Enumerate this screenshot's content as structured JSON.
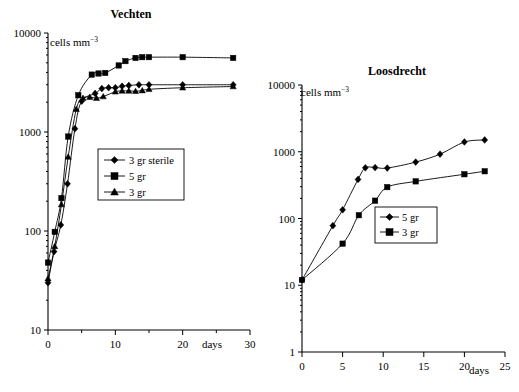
{
  "figure": {
    "background": "#ffffff",
    "ink": "#000000",
    "panels": [
      "left",
      "right"
    ]
  },
  "chart_data": [
    {
      "id": "vechten",
      "type": "line",
      "title": "Vechten",
      "xlabel": "days",
      "ylabel": "cells mm⁻³",
      "yscale": "log",
      "ylim": [
        10,
        10000
      ],
      "xlim": [
        0,
        30
      ],
      "yticklabels": [
        "10000",
        "1000",
        "100",
        "10"
      ],
      "ytickvalues": [
        10000,
        1000,
        100,
        10
      ],
      "xticklabels": [
        "0",
        "10",
        "20",
        "30"
      ],
      "xtickvalues": [
        0,
        10,
        20,
        30
      ],
      "xminorticks": [
        5,
        15,
        25
      ],
      "grid": false,
      "legend_position": "center-left",
      "series": [
        {
          "name": "3 gr sterile",
          "marker": "diamond",
          "x": [
            0,
            0.9,
            1.9,
            2.9,
            4.0,
            5.0,
            7.0,
            8.0,
            9.0,
            10.0,
            11.0,
            12.0,
            13.5,
            15.0,
            20.0,
            27.5
          ],
          "y": [
            30,
            62,
            115,
            300,
            1080,
            2050,
            2450,
            2750,
            2800,
            2800,
            2900,
            2950,
            3000,
            3000,
            3000,
            3000
          ]
        },
        {
          "name": "5 gr",
          "marker": "square",
          "x": [
            0,
            1.0,
            2.0,
            3.0,
            4.5,
            6.5,
            7.5,
            8.5,
            10.5,
            11.5,
            13.0,
            14.0,
            15.0,
            20.0,
            27.5
          ],
          "y": [
            48,
            98,
            215,
            900,
            2350,
            3800,
            3900,
            3950,
            4700,
            5200,
            5600,
            5700,
            5700,
            5700,
            5600
          ]
        },
        {
          "name": "3 gr",
          "marker": "triangle",
          "x": [
            0,
            1.0,
            2.0,
            3.0,
            4.2,
            5.2,
            6.2,
            7.2,
            8.2,
            10.0,
            11.0,
            12.0,
            13.0,
            14.0,
            15.0,
            20.0,
            27.5
          ],
          "y": [
            33,
            70,
            185,
            560,
            1700,
            2200,
            2250,
            2200,
            2280,
            2550,
            2600,
            2600,
            2580,
            2620,
            2700,
            2800,
            2880
          ]
        }
      ]
    },
    {
      "id": "loosdrecht",
      "type": "line",
      "title": "Loosdrecht",
      "xlabel": "days",
      "ylabel": "cells mm⁻³",
      "yscale": "log",
      "ylim": [
        1,
        10000
      ],
      "xlim": [
        0,
        25
      ],
      "yticklabels": [
        "10000",
        "1000",
        "100",
        "10",
        "1"
      ],
      "ytickvalues": [
        10000,
        1000,
        100,
        10,
        1
      ],
      "xticklabels": [
        "0",
        "5",
        "10",
        "15",
        "20",
        "25"
      ],
      "xtickvalues": [
        0,
        5,
        10,
        15,
        20,
        25
      ],
      "xminorticks": [],
      "grid": false,
      "legend_position": "center",
      "series": [
        {
          "name": "5 gr",
          "marker": "diamond",
          "x": [
            0,
            3.8,
            5.0,
            6.9,
            7.8,
            9.0,
            10.5,
            14.0,
            17.0,
            20.0,
            22.5
          ],
          "y": [
            12,
            78,
            135,
            385,
            575,
            580,
            570,
            700,
            920,
            1400,
            1500
          ]
        },
        {
          "name": "3 gr",
          "marker": "square",
          "x": [
            0,
            5.0,
            7.0,
            9.0,
            10.5,
            14.0,
            20.0,
            22.5
          ],
          "y": [
            12,
            42,
            112,
            185,
            295,
            360,
            460,
            510
          ]
        }
      ]
    }
  ]
}
